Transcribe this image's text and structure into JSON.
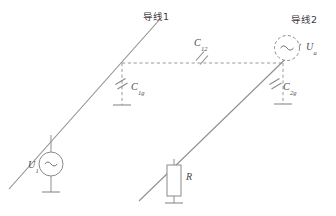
{
  "figure": {
    "background_color": "#ffffff",
    "line_color": "#8a8a8a",
    "text_color": "#4a4a4a"
  },
  "conductors": [
    {
      "id": "conductor-1",
      "label": "导线1",
      "label_position": {
        "x": 143,
        "y": 12
      }
    },
    {
      "id": "conductor-2",
      "label": "导线2",
      "label_position": {
        "x": 291,
        "y": 15
      }
    }
  ],
  "capacitors": [
    {
      "id": "coupling-capacitor",
      "symbol": "C",
      "subscript": "12",
      "label_position": {
        "x": 194,
        "y": 38
      },
      "description": "coupling capacitance between conductor 1 and conductor 2"
    },
    {
      "id": "ground-capacitor-1",
      "symbol": "C",
      "subscript": "1g",
      "label_position": {
        "x": 131,
        "y": 82
      },
      "description": "capacitance from conductor 1 to ground"
    },
    {
      "id": "ground-capacitor-2",
      "symbol": "C",
      "subscript": "2g",
      "label_position": {
        "x": 283,
        "y": 82
      },
      "description": "capacitance from conductor 2 to ground"
    }
  ],
  "sources": [
    {
      "id": "source-u1",
      "symbol": "U",
      "subscript": "1",
      "glyph": "∼",
      "outline": "solid",
      "label_position": {
        "x": 28,
        "y": 160
      }
    },
    {
      "id": "source-ua",
      "symbol": "U",
      "subscript": "a",
      "glyph": "∼",
      "outline": "dashed",
      "label_position": {
        "x": 306,
        "y": 42
      }
    }
  ],
  "resistors": [
    {
      "id": "resistor-r",
      "symbol": "R",
      "label_position": {
        "x": 186,
        "y": 172
      }
    }
  ],
  "grounds": [
    {
      "id": "ground-source-u1"
    },
    {
      "id": "ground-capacitor-1"
    },
    {
      "id": "ground-capacitor-2"
    },
    {
      "id": "ground-resistor-r"
    }
  ]
}
